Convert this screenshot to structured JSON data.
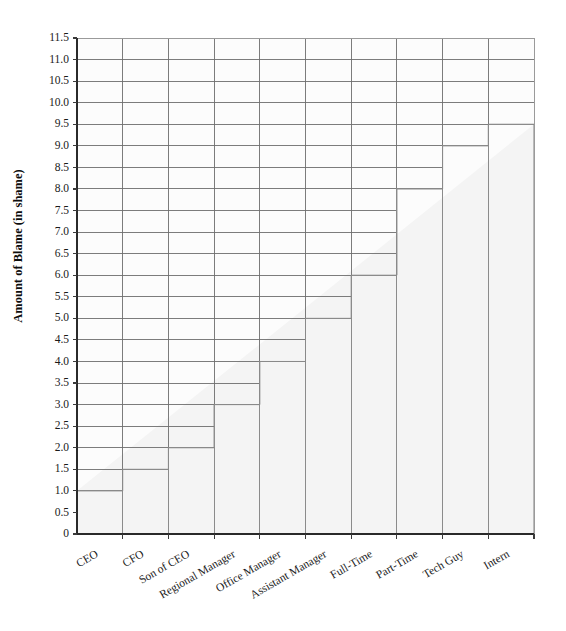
{
  "chart_data": {
    "type": "bar",
    "title": "",
    "subtitle": "",
    "xlabel": "",
    "ylabel": "Amount of Blame (in shame)",
    "categories": [
      "CEO",
      "CFO",
      "Son of CEO",
      "Regional Manager",
      "Office Manager",
      "Assistant Manager",
      "Full-Time",
      "Part-Time",
      "Tech Guy",
      "Intern"
    ],
    "values": [
      1.0,
      1.5,
      2.0,
      3.0,
      4.0,
      5.0,
      6.0,
      8.0,
      9.0,
      9.5
    ],
    "ylim": [
      0,
      11.5
    ],
    "ytick_labels": [
      "0",
      "0.5",
      "1.0",
      "1.5",
      "2.0",
      "2.5",
      "3.0",
      "3.5",
      "4.0",
      "4.5",
      "5.0",
      "5.5",
      "6.0",
      "6.5",
      "7.0",
      "7.5",
      "8.0",
      "8.5",
      "9.0",
      "9.5",
      "10.0",
      "10.5",
      "11.0",
      "11.5"
    ],
    "ytick_values": [
      0,
      0.5,
      1.0,
      1.5,
      2.0,
      2.5,
      3.0,
      3.5,
      4.0,
      4.5,
      5.0,
      5.5,
      6.0,
      6.5,
      7.0,
      7.5,
      8.0,
      8.5,
      9.0,
      9.5,
      10.0,
      10.5,
      11.0,
      11.5
    ],
    "grid": true,
    "legend": false,
    "legend_position": "none",
    "colors": {
      "background": "#ffffff",
      "grid": "#6e6e6e",
      "axis": "#2a2a2a",
      "bar_outline": "#808080",
      "bar_fill": "#fbfbfb",
      "text": "#1a1a1a"
    }
  },
  "layout": {
    "plot_left": 77,
    "plot_right": 534,
    "plot_top": 38,
    "plot_bottom": 534,
    "xtick_rotation": -30
  }
}
